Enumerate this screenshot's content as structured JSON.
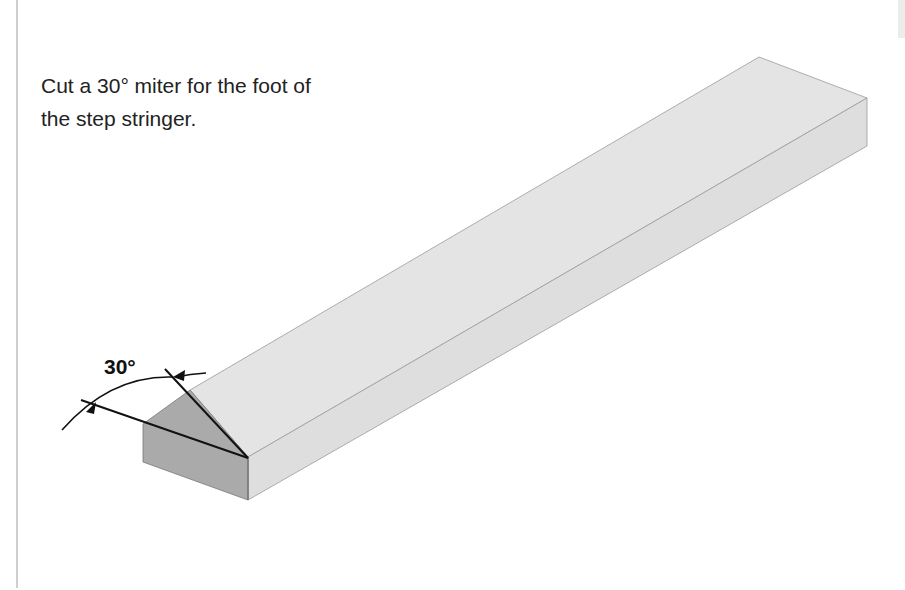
{
  "instruction": {
    "line1": "Cut a 30° miter for the foot of",
    "line2": "the step stringer."
  },
  "diagram": {
    "angle_label": "30°",
    "colors": {
      "board_top": "#e3e3e3",
      "board_side": "#dcdcdc",
      "miter_face": "#a9a9a9",
      "outline": "#111111",
      "edge_light": "#9a9a9a"
    }
  }
}
